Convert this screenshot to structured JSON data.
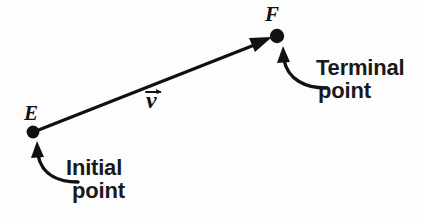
{
  "figure": {
    "type": "vector-diagram",
    "background_color": "#fdfdfd",
    "ink_color": "#111111",
    "title": "",
    "points": {
      "initial": {
        "label": "E",
        "callout_line_1": "Initial",
        "callout_line_2": "point",
        "x": 33,
        "y": 132
      },
      "terminal": {
        "label": "F",
        "callout_line_1": "Terminal",
        "callout_line_2": "point",
        "x": 277,
        "y": 36
      }
    },
    "vector": {
      "name": "v",
      "accent": "arrow-over",
      "from": "E",
      "to": "F",
      "shaft_width": 3
    }
  }
}
